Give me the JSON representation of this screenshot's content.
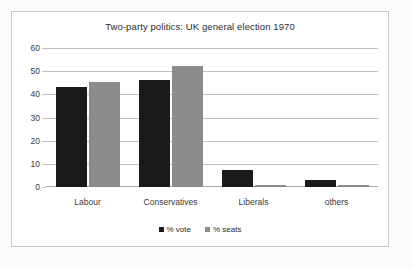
{
  "chart_data": {
    "type": "bar",
    "title": "Two-party politics: UK general election 1970",
    "xlabel": "",
    "ylabel": "",
    "ylim": [
      0,
      60
    ],
    "yticks": [
      0,
      10,
      20,
      30,
      40,
      50,
      60
    ],
    "grid": true,
    "legend_position": "bottom",
    "categories": [
      "Labour",
      "Conservatives",
      "Liberals",
      "others"
    ],
    "series": [
      {
        "name": "% vote",
        "color": "#1a1a1a",
        "values": [
          43.0,
          46.4,
          7.5,
          3.1
        ]
      },
      {
        "name": "% seats",
        "color": "#8c8c8c",
        "values": [
          45.5,
          52.4,
          0.9,
          0.9
        ]
      }
    ]
  },
  "colors": {
    "vote": "#1a1a1a",
    "seats": "#8c8c8c",
    "gridline": "#bfbfbf",
    "frame_border": "#c9c9c9",
    "plot_background": "#ffffff",
    "page_background": "#fbfbfb"
  }
}
